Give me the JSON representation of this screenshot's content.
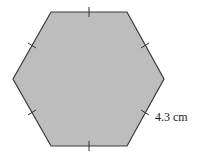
{
  "diagram": {
    "shape": "regular hexagon",
    "fill_color": "#bdbdbd",
    "stroke_color": "#3a3a3a",
    "side_label": "4.3 cm",
    "tick_marks": 6
  }
}
